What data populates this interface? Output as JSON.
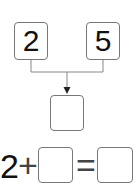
{
  "top_boxes": [
    {
      "value": "2"
    },
    {
      "value": "5"
    }
  ],
  "result_box": {
    "value": ""
  },
  "equation": {
    "first_operand": "2",
    "operator": "+",
    "second_operand": "",
    "equals": "=",
    "result": ""
  },
  "colors": {
    "border": "#777777",
    "line": "#888888",
    "text": "#111111"
  }
}
